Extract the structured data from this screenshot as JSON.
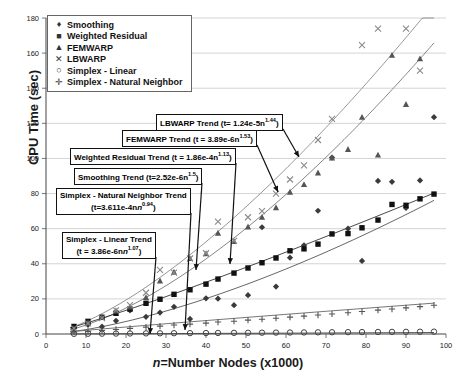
{
  "chart_data": {
    "type": "scatter",
    "title": "",
    "xlabel": "n=Number Nodes (x1000)",
    "ylabel": "CPU Time (sec)",
    "xlim": [
      0,
      100
    ],
    "ylim": [
      0,
      180
    ],
    "xticks": [
      0,
      10,
      20,
      30,
      40,
      50,
      60,
      70,
      80,
      90,
      100
    ],
    "yticks": [
      0,
      20,
      40,
      60,
      80,
      100,
      120,
      140,
      160,
      180
    ],
    "grid": "horizontal",
    "legend_position": "top-left",
    "series": [
      {
        "name": "Smoothing",
        "marker": "diamond",
        "color": "#3a3a3a",
        "x": [
          7,
          10.5,
          14,
          17.5,
          21,
          25,
          28.5,
          32,
          36,
          40,
          43,
          47,
          50.5,
          54,
          57.5,
          61,
          64.5,
          68,
          71.5,
          75.5,
          79,
          83,
          86.5,
          90,
          93.5,
          97
        ],
        "y": [
          3.5,
          5.2,
          4.2,
          7.5,
          13.5,
          9.8,
          12.2,
          15.5,
          8.6,
          20.3,
          20.1,
          16.4,
          22.1,
          60.8,
          27.0,
          43.5,
          50.5,
          70.2,
          100.5,
          60.0,
          41.6,
          87.2,
          86.7,
          71.8,
          87.5,
          123.5
        ]
      },
      {
        "name": "Weighted Residual",
        "marker": "square",
        "color": "#111111",
        "x": [
          7,
          10.5,
          14,
          17.5,
          21,
          25,
          28.5,
          32,
          36,
          40,
          43,
          47,
          50.5,
          54,
          57.5,
          61,
          64.5,
          68,
          71.5,
          75.5,
          79,
          83,
          86.5,
          90,
          93.5,
          97
        ],
        "y": [
          4.3,
          7.2,
          9.5,
          11.8,
          14.2,
          17.5,
          19.8,
          22.6,
          25.2,
          28.4,
          31.3,
          34.7,
          37.6,
          40.6,
          43.3,
          47.4,
          48.5,
          51.2,
          57.0,
          57.2,
          60.5,
          64.9,
          73.8,
          73.3,
          77.0,
          79.7
        ]
      },
      {
        "name": "FEMWARP",
        "marker": "triangle",
        "color": "#555555",
        "x": [
          7,
          10.5,
          14,
          17.5,
          21,
          25,
          28.5,
          32,
          36,
          40,
          43,
          47,
          50.5,
          54,
          57.5,
          61,
          64.5,
          68,
          71.5,
          75.5,
          79,
          83,
          86.5,
          90,
          93.5
        ],
        "y": [
          3.0,
          6.5,
          9.7,
          13.2,
          15.4,
          20.8,
          30.3,
          35.3,
          43.0,
          45.8,
          57.5,
          52.8,
          61.0,
          66.5,
          72.0,
          80.8,
          85.2,
          91.8,
          100.3,
          105.2,
          123.5,
          102.0,
          158.8,
          130.8,
          156.8
        ]
      },
      {
        "name": "LBWARP",
        "marker": "cross",
        "color": "#8a8a8a",
        "x": [
          7,
          10.5,
          14,
          17.5,
          21,
          25,
          28.5,
          32,
          36,
          40,
          43,
          47,
          50.5,
          54,
          57.5,
          61,
          64.5,
          68,
          71.5,
          79,
          83,
          90,
          93.5
        ],
        "y": [
          3.2,
          6.0,
          9.0,
          13.5,
          16.5,
          23.5,
          36.5,
          35.0,
          43.0,
          46.0,
          64.0,
          53.0,
          66.5,
          70.0,
          80.0,
          88.0,
          96.0,
          110.5,
          122.5,
          164.5,
          174.0,
          174.0,
          150.0
        ]
      },
      {
        "name": "Simplex - Linear",
        "marker": "circle",
        "color": "#444444",
        "x": [
          7,
          10.5,
          14,
          17.5,
          21,
          25,
          28.5,
          32,
          36,
          40,
          43,
          47,
          50.5,
          54,
          57.5,
          61,
          64.5,
          68,
          71.5,
          75.5,
          79,
          83,
          86.5,
          90,
          93.5,
          97
        ],
        "y": [
          0.1,
          0.15,
          0.2,
          0.25,
          0.3,
          0.35,
          0.4,
          0.45,
          0.5,
          0.55,
          0.6,
          0.65,
          0.7,
          0.75,
          0.8,
          0.85,
          0.9,
          0.95,
          1.0,
          1.05,
          1.1,
          1.15,
          1.2,
          1.25,
          1.3,
          1.35
        ]
      },
      {
        "name": "Simplex - Natural Neighbor",
        "marker": "plus",
        "color": "#555555",
        "x": [
          7,
          10.5,
          14,
          17.5,
          21,
          25,
          28.5,
          32,
          36,
          40,
          43,
          47,
          50.5,
          54,
          57.5,
          61,
          64.5,
          68,
          71.5,
          75.5,
          79,
          83,
          86.5,
          90,
          93.5,
          97
        ],
        "y": [
          1.0,
          1.5,
          2.0,
          2.6,
          3.2,
          3.9,
          4.5,
          5.1,
          5.6,
          6.2,
          6.8,
          7.3,
          7.9,
          8.4,
          9.0,
          9.6,
          10.2,
          10.8,
          11.4,
          12.1,
          12.8,
          13.6,
          14.2,
          14.9,
          15.6,
          16.4
        ]
      }
    ],
    "trendlines": [
      {
        "name": "LBWARP Trend",
        "coef": 1.24e-05,
        "exp": 1.44,
        "color": "#8a8a8a",
        "x_from": 6,
        "x_to": 97
      },
      {
        "name": "FEMWARP Trend",
        "coef": 3.89e-06,
        "exp": 1.53,
        "color": "#777777",
        "x_from": 6,
        "x_to": 97
      },
      {
        "name": "Weighted Residual Trend",
        "coef": 0.000186,
        "exp": 1.13,
        "color": "#333333",
        "x_from": 6,
        "x_to": 97
      },
      {
        "name": "Smoothing Trend",
        "coef": 2.52e-06,
        "exp": 1.5,
        "color": "#555555",
        "x_from": 6,
        "x_to": 97
      },
      {
        "name": "Simplex - Natural Neighbor Trend",
        "coef": 0.0003611,
        "exp": 0.94,
        "color": "#666666",
        "x_from": 6,
        "x_to": 97
      },
      {
        "name": "Simplex - Linear Trend",
        "coef": 3.86e-06,
        "exp": 1.07,
        "color": "#444444",
        "x_from": 6,
        "x_to": 97
      }
    ],
    "annotations": [
      {
        "id": "lbwarp",
        "text": "LBWARP Trend (t= 1.24e-5n",
        "sup": "1.44",
        "tail": ")",
        "box": [
          156,
          114
        ],
        "arrow_to": [
          299,
          157
        ]
      },
      {
        "id": "femwarp",
        "text": "FEMWARP  Trend (t = 3.89e-6n",
        "sup": "1.53",
        "tail": ")",
        "box": [
          122,
          130
        ],
        "arrow_to": [
          278,
          192
        ]
      },
      {
        "id": "wres",
        "text": "Weighted Residual Trend (t = 1.86e-4n",
        "sup": "1.13",
        "tail": ")",
        "box": [
          70,
          148
        ],
        "arrow_to": [
          230,
          264
        ]
      },
      {
        "id": "smooth",
        "text": "Smoothing Trend (t=2.52e-6n",
        "sup": "1.5",
        "tail": ")",
        "box": [
          74,
          168
        ],
        "arrow_to": [
          196,
          270
        ]
      },
      {
        "id": "snn",
        "text": "Simplex - Natural Neighbor Trend",
        "line2": "(t=3.611e-4n",
        "sup": "0.94",
        "tail": ")",
        "box": [
          56,
          188
        ],
        "arrow_to": [
          185,
          330
        ]
      },
      {
        "id": "slin",
        "text": "Simplex - Linear Trend",
        "line2": "(t = 3.86e-6n",
        "sup": "1.07",
        "tail": ")",
        "box": [
          62,
          232
        ],
        "arrow_to": [
          150,
          334
        ]
      }
    ]
  },
  "legend": {
    "items": [
      {
        "label": "Smoothing",
        "marker": "♦"
      },
      {
        "label": "Weighted Residual",
        "marker": "■"
      },
      {
        "label": "FEMWARP",
        "marker": "▲"
      },
      {
        "label": "LBWARP",
        "marker": "✕"
      },
      {
        "label": "Simplex - Linear",
        "marker": "○"
      },
      {
        "label": "Simplex - Natural Neighbor",
        "marker": "✛"
      }
    ]
  },
  "axis": {
    "y_title": "CPU Time (sec)",
    "x_title_italic": "n",
    "x_title_rest": "=Number Nodes (x1000)"
  }
}
